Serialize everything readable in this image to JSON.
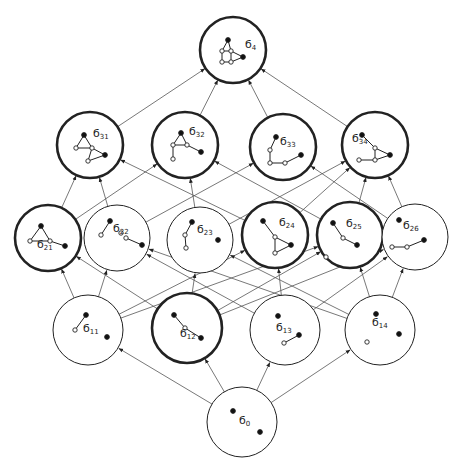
{
  "diagram": {
    "colors": {
      "stroke": "#222222",
      "edge": "#555555",
      "background": "#ffffff"
    },
    "nodes": [
      {
        "id": "s4",
        "label": "б",
        "sub": "4",
        "cx": 233,
        "cy": 50,
        "r": 33,
        "bold": true
      },
      {
        "id": "s31",
        "label": "б",
        "sub": "31",
        "cx": 90,
        "cy": 145,
        "r": 33,
        "bold": true
      },
      {
        "id": "s32",
        "label": "б",
        "sub": "32",
        "cx": 185,
        "cy": 145,
        "r": 33,
        "bold": true
      },
      {
        "id": "s33",
        "label": "б",
        "sub": "33",
        "cx": 283,
        "cy": 147,
        "r": 33,
        "bold": true
      },
      {
        "id": "s34",
        "label": "б",
        "sub": "34",
        "cx": 375,
        "cy": 145,
        "r": 33,
        "bold": true
      },
      {
        "id": "s21",
        "label": "б",
        "sub": "21",
        "cx": 48,
        "cy": 238,
        "r": 33,
        "bold": true
      },
      {
        "id": "s22",
        "label": "б",
        "sub": "22",
        "cx": 117,
        "cy": 238,
        "r": 33,
        "bold": false
      },
      {
        "id": "s23",
        "label": "б",
        "sub": "23",
        "cx": 200,
        "cy": 240,
        "r": 33,
        "bold": false
      },
      {
        "id": "s24",
        "label": "б",
        "sub": "24",
        "cx": 275,
        "cy": 235,
        "r": 33,
        "bold": true
      },
      {
        "id": "s25",
        "label": "б",
        "sub": "25",
        "cx": 350,
        "cy": 235,
        "r": 33,
        "bold": true
      },
      {
        "id": "s26",
        "label": "б",
        "sub": "26",
        "cx": 415,
        "cy": 237,
        "r": 33,
        "bold": false
      },
      {
        "id": "s11",
        "label": "б",
        "sub": "11",
        "cx": 88,
        "cy": 330,
        "r": 35,
        "bold": false
      },
      {
        "id": "s12",
        "label": "б",
        "sub": "12",
        "cx": 187,
        "cy": 328,
        "r": 35,
        "bold": true
      },
      {
        "id": "s13",
        "label": "б",
        "sub": "13",
        "cx": 285,
        "cy": 330,
        "r": 35,
        "bold": false
      },
      {
        "id": "s14",
        "label": "б",
        "sub": "14",
        "cx": 380,
        "cy": 330,
        "r": 35,
        "bold": false
      },
      {
        "id": "s0",
        "label": "б",
        "sub": "0",
        "cx": 242,
        "cy": 422,
        "r": 35,
        "bold": false
      }
    ],
    "edges": [
      [
        "s0",
        "s11"
      ],
      [
        "s0",
        "s12"
      ],
      [
        "s0",
        "s13"
      ],
      [
        "s0",
        "s14"
      ],
      [
        "s11",
        "s21"
      ],
      [
        "s11",
        "s22"
      ],
      [
        "s11",
        "s24"
      ],
      [
        "s11",
        "s25"
      ],
      [
        "s12",
        "s21"
      ],
      [
        "s12",
        "s23"
      ],
      [
        "s12",
        "s25"
      ],
      [
        "s12",
        "s26"
      ],
      [
        "s13",
        "s22"
      ],
      [
        "s13",
        "s24"
      ],
      [
        "s13",
        "s26"
      ],
      [
        "s14",
        "s22"
      ],
      [
        "s14",
        "s23"
      ],
      [
        "s14",
        "s25"
      ],
      [
        "s14",
        "s26"
      ],
      [
        "s21",
        "s31"
      ],
      [
        "s21",
        "s32"
      ],
      [
        "s22",
        "s31"
      ],
      [
        "s22",
        "s33"
      ],
      [
        "s23",
        "s32"
      ],
      [
        "s23",
        "s34"
      ],
      [
        "s24",
        "s31"
      ],
      [
        "s24",
        "s34"
      ],
      [
        "s25",
        "s32"
      ],
      [
        "s25",
        "s34"
      ],
      [
        "s26",
        "s33"
      ],
      [
        "s26",
        "s34"
      ],
      [
        "s31",
        "s4"
      ],
      [
        "s32",
        "s4"
      ],
      [
        "s33",
        "s4"
      ],
      [
        "s34",
        "s4"
      ]
    ],
    "glyphs": {
      "s4": {
        "pts": [
          [
            -5,
            -10,
            1
          ],
          [
            -11,
            1,
            0
          ],
          [
            -2,
            1,
            0
          ],
          [
            -11,
            12,
            0
          ],
          [
            -2,
            12,
            0
          ],
          [
            10,
            7,
            1
          ]
        ],
        "segs": [
          [
            0,
            1
          ],
          [
            0,
            2
          ],
          [
            1,
            2
          ],
          [
            1,
            3
          ],
          [
            2,
            4
          ],
          [
            3,
            4
          ],
          [
            2,
            5
          ],
          [
            4,
            5
          ]
        ],
        "lx": 12,
        "ly": -2
      },
      "s31": {
        "pts": [
          [
            -6,
            -10,
            1
          ],
          [
            -14,
            3,
            0
          ],
          [
            2,
            3,
            0
          ],
          [
            15,
            10,
            1
          ],
          [
            -2,
            16,
            0
          ]
        ],
        "segs": [
          [
            0,
            1
          ],
          [
            0,
            2
          ],
          [
            1,
            2
          ],
          [
            2,
            3
          ],
          [
            2,
            4
          ],
          [
            3,
            4
          ]
        ],
        "lx": 3,
        "ly": -8
      },
      "s32": {
        "pts": [
          [
            -4,
            -12,
            1
          ],
          [
            -12,
            0,
            0
          ],
          [
            2,
            0,
            0
          ],
          [
            -12,
            14,
            0
          ],
          [
            16,
            7,
            1
          ]
        ],
        "segs": [
          [
            0,
            1
          ],
          [
            0,
            2
          ],
          [
            1,
            2
          ],
          [
            1,
            3
          ],
          [
            2,
            4
          ]
        ],
        "lx": 4,
        "ly": -10
      },
      "s33": {
        "pts": [
          [
            -7,
            -10,
            1
          ],
          [
            -13,
            3,
            0
          ],
          [
            -13,
            16,
            0
          ],
          [
            2,
            16,
            0
          ],
          [
            18,
            8,
            1
          ]
        ],
        "segs": [
          [
            0,
            1
          ],
          [
            1,
            2
          ],
          [
            2,
            3
          ],
          [
            3,
            4
          ]
        ],
        "lx": -3,
        "ly": -2
      },
      "s34": {
        "pts": [
          [
            -13,
            -10,
            1
          ],
          [
            0,
            3,
            0
          ],
          [
            15,
            10,
            1
          ],
          [
            0,
            15,
            0
          ],
          [
            -16,
            15,
            0
          ]
        ],
        "segs": [
          [
            0,
            1
          ],
          [
            1,
            2
          ],
          [
            1,
            3
          ],
          [
            2,
            3
          ],
          [
            3,
            4
          ]
        ],
        "lx": -23,
        "ly": -3
      },
      "s21": {
        "pts": [
          [
            -7,
            -12,
            1
          ],
          [
            -18,
            3,
            0
          ],
          [
            2,
            3,
            0
          ],
          [
            17,
            8,
            1
          ]
        ],
        "segs": [
          [
            0,
            1
          ],
          [
            0,
            2
          ],
          [
            1,
            2
          ],
          [
            2,
            3
          ]
        ],
        "lx": -11,
        "ly": 10
      },
      "s22": {
        "pts": [
          [
            -7,
            -17,
            1
          ],
          [
            -16,
            -3,
            0
          ],
          [
            4,
            -5,
            0
          ],
          [
            9,
            0,
            0
          ],
          [
            25,
            7,
            1
          ]
        ],
        "segs": [
          [
            0,
            1
          ],
          [
            3,
            4
          ]
        ],
        "lx": -4,
        "ly": -6
      },
      "s23": {
        "pts": [
          [
            -8,
            -18,
            1
          ],
          [
            -15,
            -5,
            0
          ],
          [
            -14,
            8,
            0
          ],
          [
            18,
            0,
            1
          ]
        ],
        "segs": [
          [
            0,
            1
          ],
          [
            1,
            2
          ]
        ],
        "lx": -3,
        "ly": -7
      },
      "s24": {
        "pts": [
          [
            -12,
            -14,
            1
          ],
          [
            0,
            2,
            0
          ],
          [
            16,
            10,
            1
          ],
          [
            0,
            18,
            0
          ]
        ],
        "segs": [
          [
            0,
            1
          ],
          [
            1,
            2
          ],
          [
            1,
            3
          ],
          [
            2,
            3
          ]
        ],
        "lx": 4,
        "ly": -9
      },
      "s25": {
        "pts": [
          [
            -17,
            -12,
            1
          ],
          [
            -7,
            3,
            0
          ],
          [
            7,
            10,
            1
          ],
          [
            -24,
            22,
            0
          ]
        ],
        "segs": [
          [
            0,
            1
          ],
          [
            1,
            2
          ]
        ],
        "lx": -4,
        "ly": -8
      },
      "s26": {
        "pts": [
          [
            -16,
            -17,
            1
          ],
          [
            -23,
            10,
            0
          ],
          [
            -8,
            10,
            0
          ],
          [
            9,
            3,
            1
          ]
        ],
        "segs": [
          [
            1,
            2
          ],
          [
            2,
            3
          ]
        ],
        "lx": -12,
        "ly": -8
      },
      "s11": {
        "pts": [
          [
            -2,
            -15,
            1
          ],
          [
            -13,
            0,
            0
          ],
          [
            19,
            7,
            1
          ]
        ],
        "segs": [
          [
            0,
            1
          ]
        ],
        "lx": -5,
        "ly": 2
      },
      "s12": {
        "pts": [
          [
            -13,
            -13,
            1
          ],
          [
            -2,
            0,
            0
          ],
          [
            14,
            10,
            1
          ]
        ],
        "segs": [
          [
            0,
            1
          ],
          [
            1,
            2
          ]
        ],
        "lx": -7,
        "ly": 9
      },
      "s13": {
        "pts": [
          [
            -7,
            -14,
            1
          ],
          [
            -1,
            13,
            0
          ],
          [
            14,
            5,
            1
          ]
        ],
        "segs": [
          [
            1,
            2
          ]
        ],
        "lx": -9,
        "ly": 1
      },
      "s14": {
        "pts": [
          [
            -4,
            -16,
            1
          ],
          [
            -13,
            12,
            0
          ],
          [
            19,
            4,
            1
          ]
        ],
        "segs": [],
        "lx": -8,
        "ly": -4
      },
      "s0": {
        "pts": [
          [
            -9,
            -11,
            1
          ],
          [
            18,
            10,
            1
          ]
        ],
        "segs": [],
        "lx": -3,
        "ly": 2
      }
    }
  }
}
